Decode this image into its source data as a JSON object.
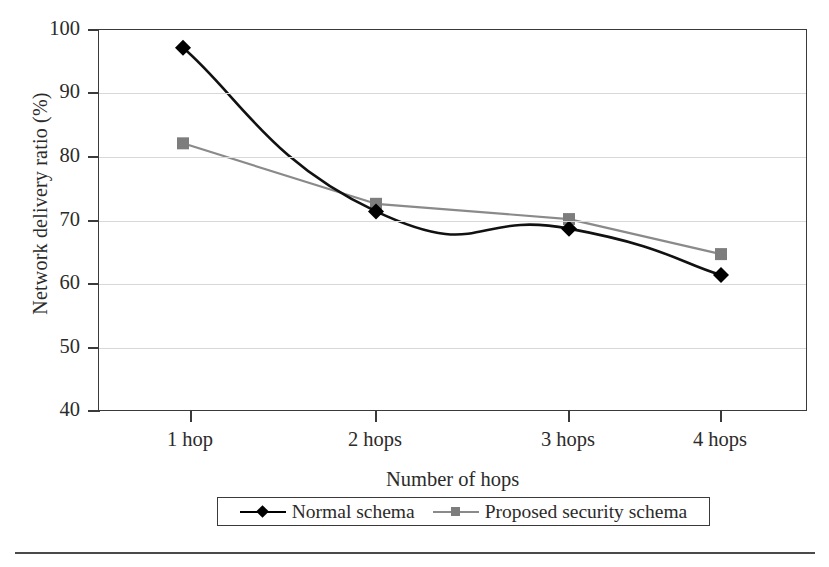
{
  "chart_data": {
    "type": "line",
    "title": "",
    "xlabel": "Number of hops",
    "ylabel": "Network delivery ratio (%)",
    "categories": [
      "1 hop",
      "2 hops",
      "3 hops",
      "4 hops"
    ],
    "ylim": [
      40,
      100
    ],
    "ytick_labels": [
      "100",
      "90",
      "80",
      "70",
      "60",
      "50",
      "40"
    ],
    "yticks": [
      100,
      90,
      80,
      70,
      60,
      50,
      40
    ],
    "grid": "horizontal",
    "legend_position": "below-axis-centered",
    "series": [
      {
        "name": "Normal schema",
        "marker": "diamond",
        "color": "#000000",
        "values": [
          97.2,
          71.5,
          68.8,
          61.5
        ]
      },
      {
        "name": "Proposed security schema",
        "marker": "square",
        "color": "#7d7d7d",
        "values": [
          82.2,
          72.7,
          70.3,
          64.8
        ]
      }
    ]
  },
  "axis": {
    "y_title": "Network delivery ratio (%)",
    "x_title": "Number of hops",
    "y_labels": [
      "100",
      "90",
      "80",
      "70",
      "60",
      "50",
      "40"
    ],
    "x_labels": [
      "1 hop",
      "2 hops",
      "3 hops",
      "4 hops"
    ]
  },
  "legend": {
    "items": [
      {
        "label": "Normal schema",
        "marker": "diamond-marker-icon"
      },
      {
        "label": "Proposed security schema",
        "marker": "square-marker-icon"
      }
    ]
  },
  "colors": {
    "series_normal": "#000000",
    "series_proposed": "#7d7d7d",
    "axis": "#3a3a3a",
    "grid": "#d8d8d8",
    "text": "#2b2b2b",
    "background": "#ffffff"
  }
}
